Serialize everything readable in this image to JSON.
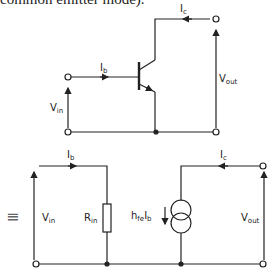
{
  "caption": "common emitter mode).",
  "top_circuit": {
    "labels": {
      "ic": "I",
      "ic_sub": "c",
      "ib": "I",
      "ib_sub": "b",
      "vin": "V",
      "vin_sub": "in",
      "vout": "V",
      "vout_sub": "out"
    }
  },
  "equivalent_circuit": {
    "equiv_symbol": "≡",
    "labels": {
      "ib": "I",
      "ib_sub": "b",
      "ic": "I",
      "ic_sub": "c",
      "vin": "V",
      "vin_sub": "in",
      "rin": "R",
      "rin_sub": "in",
      "hfe": "h",
      "hfe_sub": "fe",
      "hfe_ib": "I",
      "hfe_ib_sub": "b",
      "vout": "V",
      "vout_sub": "out"
    }
  }
}
